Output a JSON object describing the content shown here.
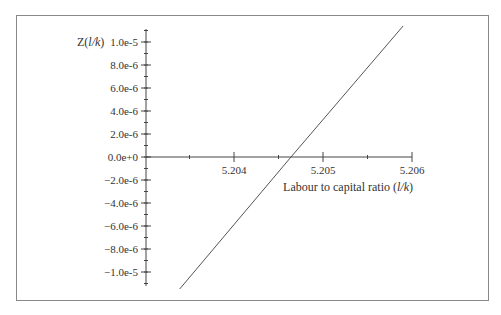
{
  "chart_data": {
    "type": "line",
    "title": "",
    "xlabel": "Labour to capital ratio (l/k)",
    "xlabel_parts": {
      "prefix": "Labour to capital ratio (",
      "italic": "l/k",
      "suffix": ")"
    },
    "ylabel": "Z(l/k)",
    "ylabel_parts": {
      "prefix": "Z(",
      "italic": "l/k",
      "suffix": ")"
    },
    "xlim": [
      5.2034,
      5.206
    ],
    "ylim": [
      -1.15e-05,
      1.15e-05
    ],
    "x_ticks": [
      5.204,
      5.205,
      5.206
    ],
    "x_tick_labels": [
      "5.204",
      "5.205",
      "5.206"
    ],
    "x_minor_ticks": [
      5.2035,
      5.2045,
      5.2055
    ],
    "y_ticks": [
      1e-05,
      8e-06,
      6e-06,
      4e-06,
      2e-06,
      0,
      -2e-06,
      -4e-06,
      -6e-06,
      -8e-06,
      -1e-05
    ],
    "y_tick_labels": [
      "1.0e-5",
      "8.0e-6",
      "6.0e-6",
      "4.0e-6",
      "2.0e-6",
      "0.0e+0",
      "−2.0e-6",
      "−4.0e-6",
      "−6.0e-6",
      "−8.0e-6",
      "−1.0e-5"
    ],
    "grid": false,
    "legend": null,
    "series": [
      {
        "name": "Z(l/k)",
        "x": [
          5.20339,
          5.20464,
          5.2059
        ],
        "y": [
          -1.148e-05,
          0.0,
          1.139e-05
        ],
        "color": "#555555"
      }
    ],
    "annotations": []
  },
  "colors": {
    "frame": "#888888",
    "axis": "#444444",
    "line": "#555555",
    "background": "#ffffff"
  }
}
